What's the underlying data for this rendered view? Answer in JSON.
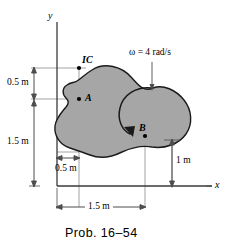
{
  "figure": {
    "caption": "Prob. 16–54",
    "axes": {
      "y_label": "y",
      "x_label": "x"
    },
    "points": [
      {
        "id": "IC",
        "label": "IC",
        "x": 0.5,
        "y": 2.0
      },
      {
        "id": "A",
        "label": "A",
        "x": 0.5,
        "y": 1.5
      },
      {
        "id": "B",
        "label": "B",
        "x": 1.5,
        "y": 1.0
      }
    ],
    "annotations": {
      "omega_symbol": "ω",
      "omega_equals": "=",
      "omega_value": "4 rad/s",
      "omega_text": "ω = 4 rad/s"
    },
    "dimensions": [
      {
        "id": "dim-left-upper",
        "label": "0.5 m",
        "orientation": "vertical",
        "value": 0.5
      },
      {
        "id": "dim-left-lower",
        "label": "1.5 m",
        "orientation": "vertical",
        "value": 1.5
      },
      {
        "id": "dim-bottom-short",
        "label": "0.5 m",
        "orientation": "horizontal",
        "value": 0.5
      },
      {
        "id": "dim-bottom-long",
        "label": "1.5 m",
        "orientation": "horizontal",
        "value": 1.5
      },
      {
        "id": "dim-right",
        "label": "1 m",
        "orientation": "vertical",
        "value": 1.0
      }
    ],
    "colors": {
      "body_fill": "#a6a6a6",
      "body_stroke": "#1a1a1a",
      "line": "#4d4d4d",
      "axis": "#3a3a3a",
      "text": "#000000"
    }
  }
}
